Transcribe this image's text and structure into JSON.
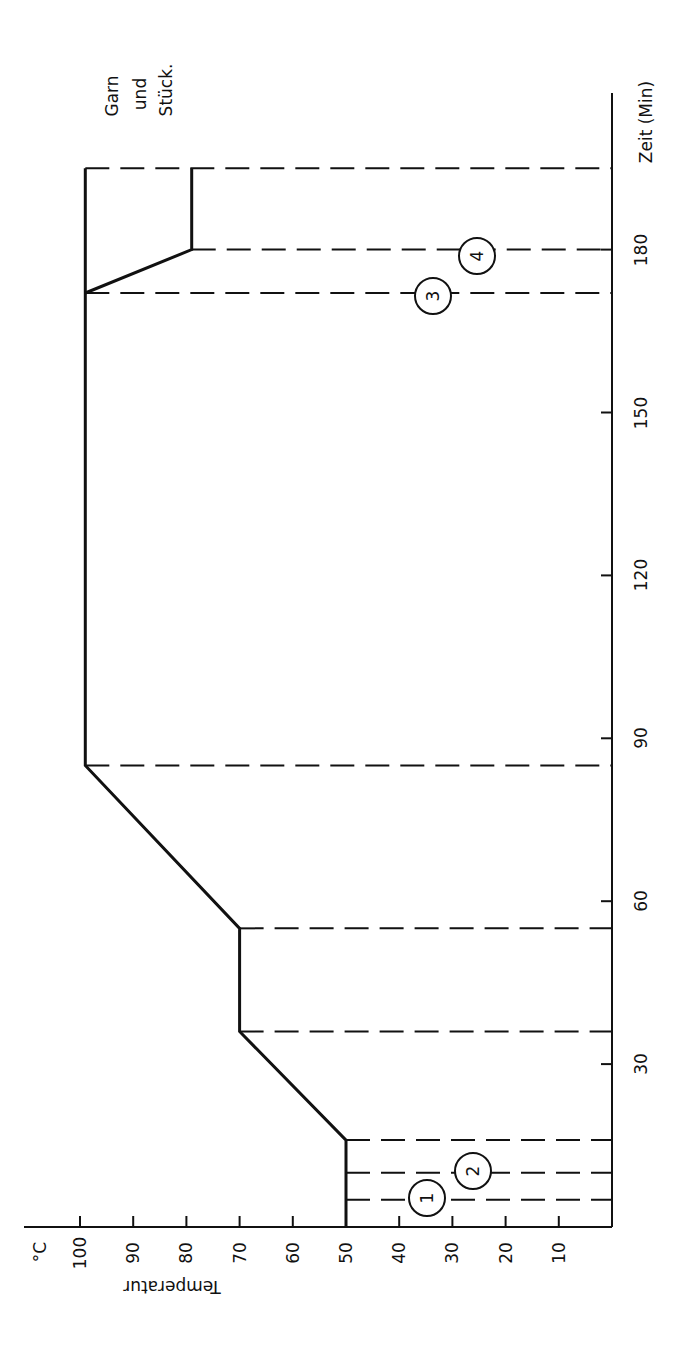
{
  "chart_data": {
    "type": "line",
    "orientation": "rotated 90° (time axis vertical on right, temperature axis horizontal at bottom, increasing to the left)",
    "title": "",
    "xlabel": "Zeit (Min)",
    "ylabel": "Temperatur",
    "y_unit": "°C",
    "xlim": [
      0,
      200
    ],
    "ylim": [
      0,
      105
    ],
    "x_ticks": [
      30,
      60,
      90,
      120,
      150,
      180
    ],
    "x_tick_labels": [
      "30",
      "60",
      "90",
      "120",
      "150",
      "180"
    ],
    "y_ticks": [
      10,
      20,
      30,
      40,
      50,
      60,
      70,
      80,
      90,
      100
    ],
    "y_tick_labels": [
      "10",
      "20",
      "30",
      "40",
      "50",
      "60",
      "70",
      "80",
      "90",
      "100"
    ],
    "grid": false,
    "series": [
      {
        "name": "Temperaturverlauf",
        "x": [
          0,
          16,
          36,
          55,
          85,
          172,
          195
        ],
        "y": [
          50,
          50,
          70,
          70,
          99,
          99,
          99
        ]
      },
      {
        "name": "Abkühlung",
        "x": [
          172,
          180,
          195
        ],
        "y": [
          99,
          79,
          79
        ]
      }
    ],
    "phase_markers_min": [
      5,
      10,
      16,
      36,
      55,
      85,
      172,
      180,
      195
    ],
    "annotations": [
      {
        "label": "1",
        "time": 5,
        "note": "circled marker"
      },
      {
        "label": "2",
        "time": 10,
        "note": "circled marker"
      },
      {
        "label": "3",
        "time": 172,
        "note": "circled marker"
      },
      {
        "label": "4",
        "time": 180,
        "note": "circled marker"
      },
      {
        "label": "Garn und Stück.",
        "time": 195,
        "note": "end label"
      }
    ]
  },
  "labels": {
    "unit": "°C",
    "y_axis_title": "Temperatur",
    "x_axis_title": "Zeit (Min)",
    "end_label_lines": [
      "Garn",
      "und",
      "Stück."
    ],
    "markers": [
      "1",
      "2",
      "3",
      "4"
    ]
  }
}
